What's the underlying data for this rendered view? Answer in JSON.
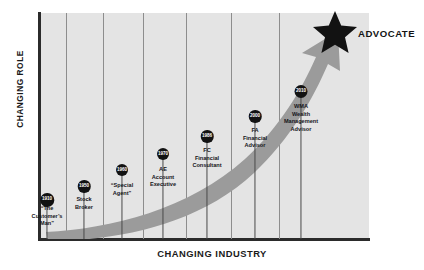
{
  "chart_data": {
    "type": "line",
    "title": "",
    "xlabel": "CHANGING INDUSTRY",
    "ylabel": "CHANGING ROLE",
    "annotation": "ADVOCATE",
    "grid": "vertical column dividers",
    "legend": "none",
    "x": [
      1910,
      1950,
      1960,
      1970,
      1986,
      2000,
      2010
    ],
    "categories": [
      "1910",
      "1950",
      "1960",
      "1970",
      "1986",
      "2000",
      "2010"
    ],
    "values": [
      5,
      12,
      20,
      30,
      45,
      64,
      86
    ],
    "series": [
      {
        "name": "Changing Role vs Changing Industry",
        "values": [
          5,
          12,
          20,
          30,
          45,
          64,
          86
        ]
      }
    ],
    "point_labels": [
      "“The Customer’s Man”",
      "Stock Broker",
      "“Special Agent”",
      "AE Account Executive",
      "FC Financial Consultant",
      "FA Financial Advisor",
      "WMA Wealth Management Advisor"
    ],
    "xlim": [
      1900,
      2020
    ],
    "ylim": [
      0,
      100
    ]
  },
  "axes": {
    "y_title": "CHANGING ROLE",
    "x_title": "CHANGING INDUSTRY"
  },
  "endpoint": {
    "label": "ADVOCATE",
    "icon": "star-icon"
  },
  "colors": {
    "panel": "#e4e4e4",
    "axis": "#2b2b2b",
    "arrow": "#9b9b9b",
    "marker": "#121212",
    "text": "#15151a",
    "divider": "#8d8d8d"
  },
  "milestones": [
    {
      "year": "1910",
      "lines": [
        "“The",
        "Customer’s",
        "Man”"
      ]
    },
    {
      "year": "1950",
      "lines": [
        "Stock",
        "Broker"
      ]
    },
    {
      "year": "1960",
      "lines": [
        "“Special",
        "Agent”"
      ]
    },
    {
      "year": "1970",
      "lines": [
        "AE",
        "Account",
        "Executive"
      ]
    },
    {
      "year": "1986",
      "lines": [
        "FC",
        "Financial",
        "Consultant"
      ]
    },
    {
      "year": "2000",
      "lines": [
        "FA",
        "Financial",
        "Advisor"
      ]
    },
    {
      "year": "2010",
      "lines": [
        "WMA",
        "Wealth",
        "Management",
        "Advisor"
      ]
    }
  ]
}
